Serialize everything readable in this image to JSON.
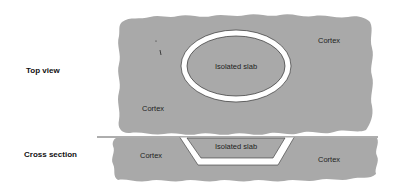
{
  "diagram": {
    "row_labels": {
      "top_view": "Top view",
      "cross_section": "Cross section"
    },
    "top_view": {
      "cortex_label": "Cortex",
      "cortex_label_2": "Cortex",
      "slab_label": "Isolated slab"
    },
    "cross_section": {
      "cortex_left_label": "Cortex",
      "cortex_right_label": "Cortex",
      "slab_label": "Isolated slab"
    },
    "colors": {
      "tissue": "#a9a9a9",
      "cut": "#ffffff",
      "outline": "#333333",
      "background": "#ffffff"
    }
  }
}
